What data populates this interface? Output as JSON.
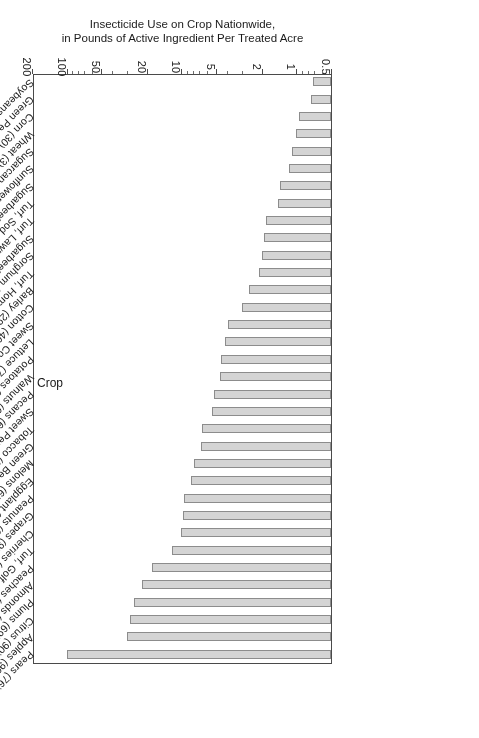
{
  "figure": {
    "background_color": "#ffffff",
    "bar_fill_color": "#d4d4d4",
    "bar_edge_color": "#8c8c8c",
    "axis_color": "#4a4a4a",
    "orientation": "rotated-180"
  },
  "chart_data": {
    "type": "bar",
    "orientation": "horizontal",
    "title": "",
    "xlabel": "Insecticide Use on Crop Nationwide,\nin Pounds of Active Ingredient Per Treated Acre",
    "xlabel_line1": "Insecticide Use on Crop Nationwide,",
    "xlabel_line2": "in Pounds of Active Ingredient Per Treated Acre",
    "ylabel": "Crop",
    "value_axis_scale": "log",
    "value_axis_range": [
      0.5,
      200
    ],
    "value_axis_ticks": [
      0.5,
      1,
      2,
      5,
      10,
      20,
      50,
      100,
      200
    ],
    "value_axis_tick_labels": [
      "0.5",
      "1",
      "2",
      "5",
      "10",
      "20",
      "50",
      "100",
      "200"
    ],
    "grid": false,
    "legend": null,
    "categories": [
      "Pears (76)",
      "Apples (90)",
      "Citrus (90)",
      "Plums (69)",
      "Almonds (81)",
      "Peaches (88)",
      "Turf, Golf Courses (88)",
      "Cherries (12)",
      "Grapes (95)",
      "Peanuts (67)",
      "Eggplant (21)",
      "Melons (65)",
      "Green Beans (49)",
      "Tobacco (27)",
      "Sweet Peppers (73)",
      "Pecans (65)",
      "Walnuts (60)",
      "Potatoes (88)",
      "Lettuce (71)",
      "Sweet Corn (88)",
      "Cotton (46)",
      "Barley (29)",
      "Turf, Homeowners (1)",
      "Sorghum (13)",
      "Sugarbeets (9)",
      "Turf, Lawn Care Services (9)",
      "Turf, Sod (5)",
      "Sugarbeets (48)",
      "Sunflowers (25)",
      "Sugarcane (64)",
      "Wheat (3)",
      "Corn (30)",
      "Green Peas (27)",
      "Soybeans (2)"
    ],
    "values": [
      100,
      30,
      28,
      26,
      22,
      18,
      12,
      10,
      9.8,
      9.5,
      8.2,
      7.8,
      6.7,
      6.6,
      5.4,
      5.2,
      4.6,
      4.5,
      4.2,
      3.9,
      3.0,
      2.6,
      2.1,
      2.0,
      1.9,
      1.85,
      1.45,
      1.4,
      1.15,
      1.1,
      1.0,
      0.95,
      0.75,
      0.72
    ]
  }
}
